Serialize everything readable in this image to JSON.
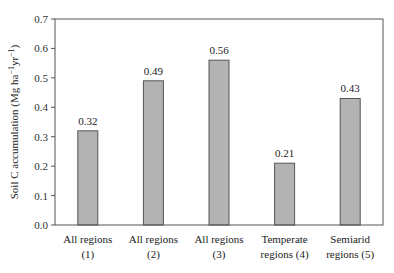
{
  "chart_data": {
    "type": "bar",
    "title": "",
    "xlabel": "",
    "ylabel": "Soil C accumulation (Mg ha⁻¹yr⁻¹)",
    "ylabel_parts": {
      "main": "Soil C accumulation (Mg ha",
      "sup1": "−1",
      "mid": "yr",
      "sup2": "−1",
      "end": ")"
    },
    "ylim": [
      0,
      0.7
    ],
    "yticks": [
      "0.0",
      "0.1",
      "0.2",
      "0.3",
      "0.4",
      "0.5",
      "0.6",
      "0.7"
    ],
    "categories": [
      [
        "All regions",
        "(1)"
      ],
      [
        "All regions",
        "(2)"
      ],
      [
        "All regions",
        "(3)"
      ],
      [
        "Temperate",
        "regions (4)"
      ],
      [
        "Semiarid",
        "regions (5)"
      ]
    ],
    "values": [
      0.32,
      0.49,
      0.56,
      0.21,
      0.43
    ],
    "value_labels": [
      "0.32",
      "0.49",
      "0.56",
      "0.21",
      "0.43"
    ],
    "grid": false,
    "legend": null,
    "colors": {
      "bar_fill": "#b3b3b3",
      "bar_stroke": "#555555",
      "axis": "#555555"
    }
  }
}
